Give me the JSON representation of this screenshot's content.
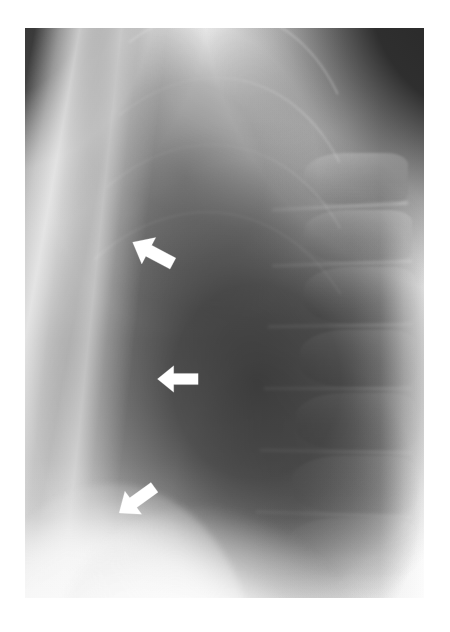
{
  "image": {
    "modality": "radiograph",
    "view": "lateral chest",
    "orientation": "patient anterior to the left, posterior (spine) to the right",
    "background_color": "#ffffff",
    "film": {
      "left": 25,
      "top": 28,
      "width": 399,
      "height": 570,
      "base_tone": "#a8a8a8",
      "darkest_tone": "#4a4a4a",
      "brightest_tone": "#ffffff"
    },
    "regions": [
      {
        "name": "upper-right-corner-air",
        "description": "dark triangular wedge of unexposed background at top right"
      },
      {
        "name": "upper-left-corner-air",
        "description": "dark band of background at top left"
      },
      {
        "name": "anterior-chest-wall",
        "description": "bright vertical soft-tissue and sternal bands down the left third"
      },
      {
        "name": "retrosternal-lung",
        "description": "dark aerated lung in the upper mid field"
      },
      {
        "name": "lung-field",
        "description": "large dark lung field occupying the centre and right of the film"
      },
      {
        "name": "thoracic-spine",
        "description": "stacked vertebral bodies and posterior ribs along the right margin"
      },
      {
        "name": "diaphragm-dome",
        "description": "bright dome of the hemidiaphragm at the lower left"
      },
      {
        "name": "posterior-soft-tissue",
        "description": "bright band of back soft tissue at the right edge"
      }
    ]
  },
  "annotations": {
    "marker_color": "#ffffff",
    "marker_count": 3,
    "arrows": [
      {
        "id": "arrow-upper",
        "label": "upper arrow",
        "direction": "down-left",
        "rotation_deg": 28,
        "x": 129,
        "y": 236,
        "width": 48,
        "height": 34,
        "points_to": "anterior pleural / chest-wall abnormality, upper level"
      },
      {
        "id": "arrow-middle",
        "label": "middle arrow",
        "direction": "left",
        "rotation_deg": 0,
        "x": 156,
        "y": 364,
        "width": 44,
        "height": 30,
        "points_to": "anterior pleural / chest-wall abnormality, mid level"
      },
      {
        "id": "arrow-lower",
        "label": "lower arrow",
        "direction": "up-left",
        "rotation_deg": -36,
        "x": 114,
        "y": 482,
        "width": 46,
        "height": 36,
        "points_to": "anterior pleural / chest-wall abnormality, lower level above the diaphragm"
      }
    ]
  },
  "ribs": [
    {
      "left": "6%",
      "top": "-26%",
      "width": "74%",
      "height": "70%",
      "border": 3,
      "rot": 18,
      "opacity": 0.3
    },
    {
      "left": "2%",
      "top": "-16%",
      "width": "78%",
      "height": "76%",
      "border": 2,
      "rot": 16,
      "opacity": 0.26
    },
    {
      "left": "0%",
      "top": "-4%",
      "width": "82%",
      "height": "82%",
      "border": 2,
      "rot": 14,
      "opacity": 0.24
    },
    {
      "left": "-2%",
      "top": "8%",
      "width": "86%",
      "height": "86%",
      "border": 2,
      "rot": 12,
      "opacity": 0.22
    },
    {
      "left": "-4%",
      "top": "20%",
      "width": "90%",
      "height": "88%",
      "border": 2,
      "rot": 10,
      "opacity": 0.2
    },
    {
      "left": "-6%",
      "top": "32%",
      "width": "94%",
      "height": "90%",
      "border": 2,
      "rot": 8,
      "opacity": 0.18
    }
  ],
  "vertebrae": [
    {
      "left": "70%",
      "top": "22%",
      "width": "26%",
      "height": "9%"
    },
    {
      "left": "70%",
      "top": "32%",
      "width": "27%",
      "height": "9%"
    },
    {
      "left": "70%",
      "top": "42%",
      "width": "28%",
      "height": "10%"
    },
    {
      "left": "69%",
      "top": "53%",
      "width": "29%",
      "height": "10%"
    },
    {
      "left": "68%",
      "top": "64%",
      "width": "30%",
      "height": "10%"
    },
    {
      "left": "67%",
      "top": "75%",
      "width": "31%",
      "height": "10%"
    },
    {
      "left": "66%",
      "top": "86%",
      "width": "32%",
      "height": "10%"
    }
  ],
  "disklines": [
    {
      "left": "62%",
      "top": "31%",
      "width": "34%",
      "rot": -3
    },
    {
      "left": "62%",
      "top": "41%",
      "width": "35%",
      "rot": -2
    },
    {
      "left": "61%",
      "top": "52%",
      "width": "36%",
      "rot": -1
    },
    {
      "left": "60%",
      "top": "63%",
      "width": "37%",
      "rot": 0
    },
    {
      "left": "59%",
      "top": "74%",
      "width": "38%",
      "rot": 1
    },
    {
      "left": "58%",
      "top": "85%",
      "width": "39%",
      "rot": 2
    }
  ]
}
